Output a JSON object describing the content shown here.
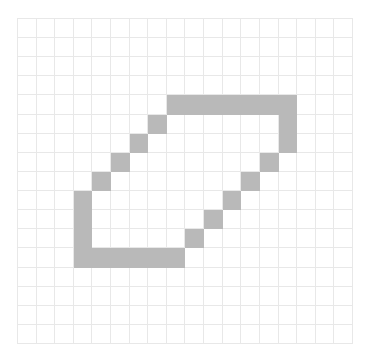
{
  "grid": {
    "cols": 18,
    "rows": 17,
    "fill_color": "#b9b9b9",
    "line_color": "#e8e8e8",
    "background": "#ffffff",
    "filled_cells": [
      [
        8,
        4
      ],
      [
        9,
        4
      ],
      [
        10,
        4
      ],
      [
        11,
        4
      ],
      [
        12,
        4
      ],
      [
        13,
        4
      ],
      [
        14,
        4
      ],
      [
        7,
        5
      ],
      [
        14,
        5
      ],
      [
        6,
        6
      ],
      [
        14,
        6
      ],
      [
        5,
        7
      ],
      [
        13,
        7
      ],
      [
        4,
        8
      ],
      [
        12,
        8
      ],
      [
        3,
        9
      ],
      [
        11,
        9
      ],
      [
        3,
        10
      ],
      [
        10,
        10
      ],
      [
        3,
        11
      ],
      [
        9,
        11
      ],
      [
        3,
        12
      ],
      [
        4,
        12
      ],
      [
        5,
        12
      ],
      [
        6,
        12
      ],
      [
        7,
        12
      ],
      [
        8,
        12
      ]
    ]
  }
}
